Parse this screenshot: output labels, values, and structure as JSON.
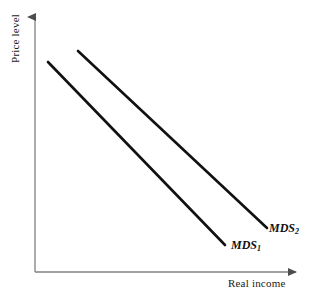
{
  "figure": {
    "background_color": "#ffffff",
    "width": 327,
    "height": 303
  },
  "axes": {
    "y_label": "Price level",
    "x_label": "Real income",
    "axis_color": "#808080",
    "origin": {
      "x": 35,
      "y": 272
    },
    "y_axis_top": {
      "x": 35,
      "y": 14
    },
    "x_axis_right": {
      "x": 300,
      "y": 272
    },
    "arrowheads": [
      "y-axis-top",
      "x-axis-right"
    ]
  },
  "curves": [
    {
      "id": "mds1",
      "label": "MDS",
      "subscript": "1",
      "color": "#111111",
      "stroke_width": 2.6,
      "start": {
        "x": 48,
        "y": 62
      },
      "end": {
        "x": 225,
        "y": 245
      },
      "description": "steeper downward-sloping line"
    },
    {
      "id": "mds2",
      "label": "MDS",
      "subscript": "2",
      "color": "#111111",
      "stroke_width": 2.6,
      "start": {
        "x": 78,
        "y": 51
      },
      "end": {
        "x": 267,
        "y": 228
      },
      "description": "flatter downward-sloping line crossing mds1"
    }
  ],
  "intersection": {
    "x": 152,
    "y": 142
  },
  "chart_data": {
    "type": "line",
    "title": "",
    "xlabel": "Real income",
    "ylabel": "Price level",
    "grid": false,
    "legend": "inline-end-labels",
    "axis_ticks": [],
    "series": [
      {
        "name": "MDS1",
        "x": [
          48,
          225
        ],
        "y": [
          62,
          245
        ]
      },
      {
        "name": "MDS2",
        "x": [
          78,
          267
        ],
        "y": [
          51,
          228
        ]
      }
    ],
    "annotations": [
      {
        "text": "MDS1",
        "x": 231,
        "y": 247
      },
      {
        "text": "MDS2",
        "x": 269,
        "y": 230
      }
    ]
  }
}
